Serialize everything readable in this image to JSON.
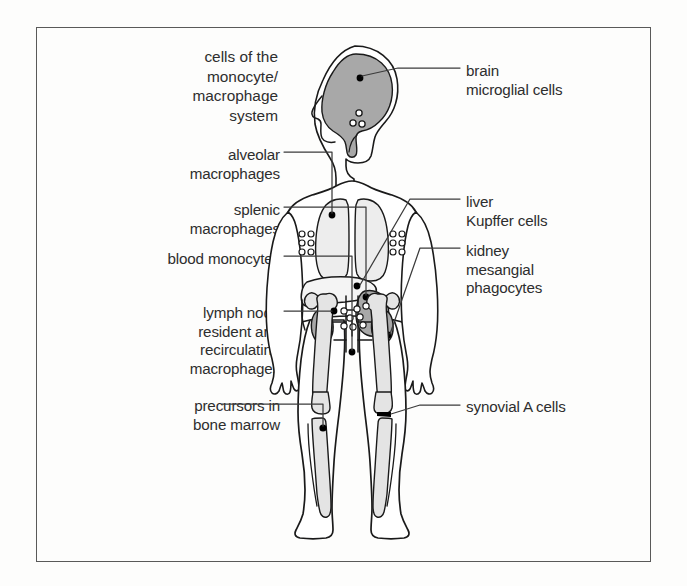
{
  "figure": {
    "title": "cells of the\nmonocyte/\nmacrophage\nsystem",
    "colors": {
      "ink": "#2e2e2e",
      "outline": "#1a1a1a",
      "organ_shaded": "#a8a8a8",
      "organ_light": "#ededed",
      "bone_fill": "#e4e4e4",
      "marker": "#000000",
      "background": "#fdfdfc",
      "frame": "#595959"
    }
  },
  "labels_left": [
    {
      "id": "alveolar-macrophages",
      "text": "alveolar\nmacrophages",
      "target": "lung"
    },
    {
      "id": "splenic-macrophages",
      "text": "splenic\nmacrophages",
      "target": "spleen"
    },
    {
      "id": "blood-monocytes",
      "text": "blood monocytes",
      "target": "blood-vessel"
    },
    {
      "id": "lymph-node-macrophages",
      "text": "lymph node\nresident and\nrecirculating\nmacrophages",
      "target": "inguinal-lymph-nodes"
    },
    {
      "id": "bone-marrow-precursors",
      "text": "precursors in\nbone marrow",
      "target": "tibia-marrow"
    }
  ],
  "labels_right": [
    {
      "id": "brain-microglial-cells",
      "text": "brain\nmicroglial cells",
      "target": "brain"
    },
    {
      "id": "liver-kupffer-cells",
      "text": "liver\nKupffer cells",
      "target": "liver"
    },
    {
      "id": "kidney-mesangial-phagocytes",
      "text": "kidney\nmesangial\nphagocytes",
      "target": "kidney"
    },
    {
      "id": "synovial-a-cells",
      "text": "synovial A cells",
      "target": "knee-joint"
    }
  ],
  "anatomy_parts": [
    "brain",
    "cervical-lymph-nodes",
    "left-lung",
    "right-lung",
    "liver",
    "spleen",
    "left-kidney",
    "right-kidney",
    "axillary-lymph-nodes",
    "inguinal-lymph-nodes",
    "femur",
    "tibia",
    "fibula",
    "knee-joint"
  ]
}
